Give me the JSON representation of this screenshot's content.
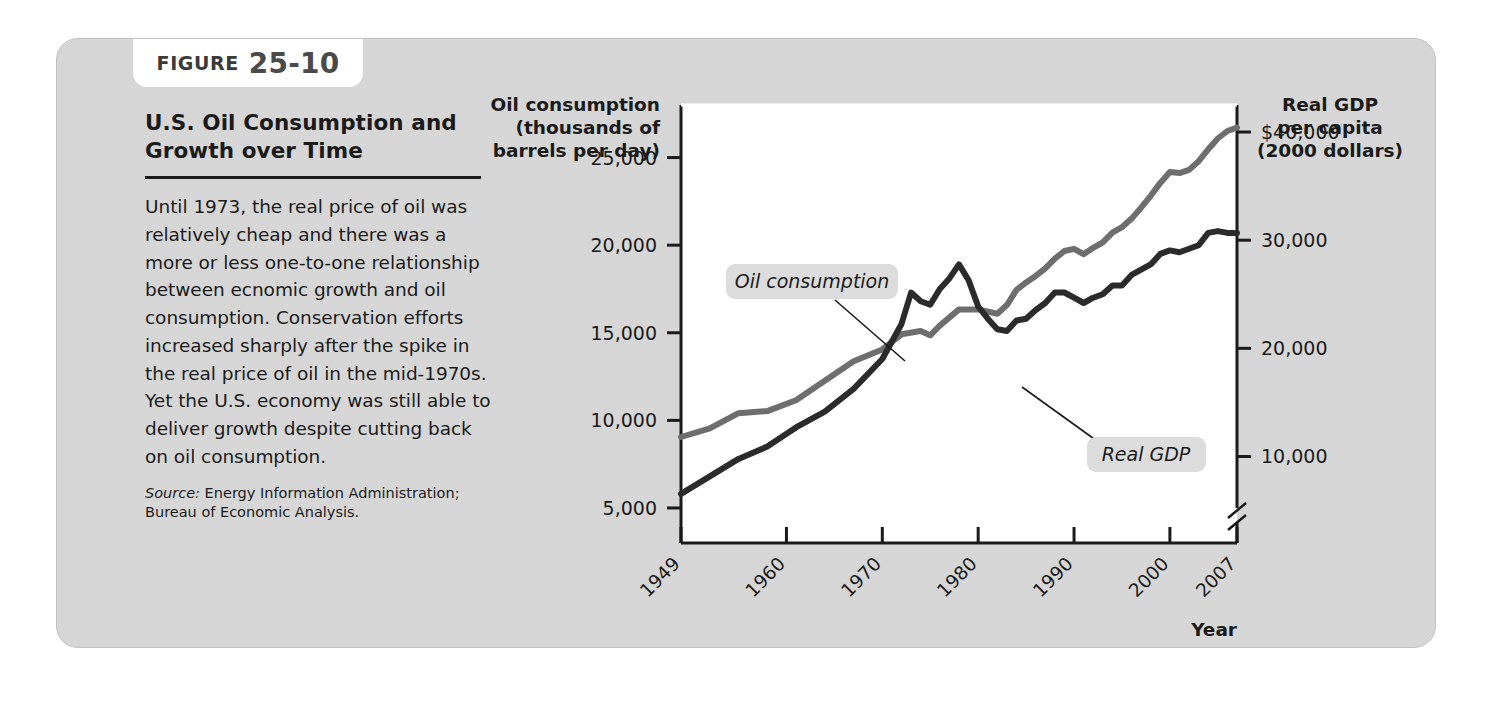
{
  "figure": {
    "label_word": "FIGURE",
    "number": "25-10"
  },
  "caption": {
    "title_line1": "U.S. Oil Consumption and",
    "title_line2": "Growth over Time",
    "body": "Until 1973, the real price of oil was relatively cheap and there was a more or less one-to-one relationship between ecnomic growth and oil consumption. Conservation efforts increased sharply after the spike in the real price of oil in the mid-1970s. Yet the U.S. economy was still able to deliver growth despite cutting back on oil consumption.",
    "source_prefix": "Source:",
    "source_text": " Energy Information Administration; Bureau of Economic Analysis."
  },
  "chart_data": {
    "type": "line",
    "title": "U.S. Oil Consumption and Growth over Time",
    "xlabel": "Year",
    "left_axis": {
      "title_lines": [
        "Oil consumption",
        "(thousands of",
        "barrels per day)"
      ],
      "ticks": [
        "5,000",
        "10,000",
        "15,000",
        "20,000",
        "25,000"
      ],
      "tick_values": [
        5000,
        10000,
        15000,
        20000,
        25000
      ],
      "ylim": [
        3000,
        28000
      ]
    },
    "right_axis": {
      "title_lines": [
        "Real GDP",
        "per capita",
        "(2000 dollars)"
      ],
      "ticks": [
        "10,000",
        "20,000",
        "30,000",
        "$40,000"
      ],
      "tick_values": [
        10000,
        20000,
        30000,
        40000
      ],
      "ylim": [
        2000,
        42500
      ],
      "axis_break": true
    },
    "x_ticks": [
      "1949",
      "1960",
      "1970",
      "1980",
      "1990",
      "2000",
      "2007"
    ],
    "x_tick_values": [
      1949,
      1960,
      1970,
      1980,
      1990,
      2000,
      2007
    ],
    "xlim": [
      1949,
      2007
    ],
    "grid": false,
    "legend_position": "inline-callout",
    "series": [
      {
        "name": "Oil consumption",
        "label": "Oil consumption",
        "color": "#2b2b2b",
        "axis": "left",
        "units": "thousands of barrels per day",
        "x": [
          1949,
          1952,
          1955,
          1958,
          1961,
          1964,
          1967,
          1970,
          1972,
          1973,
          1974,
          1975,
          1976,
          1977,
          1978,
          1979,
          1980,
          1981,
          1982,
          1983,
          1984,
          1985,
          1986,
          1987,
          1988,
          1989,
          1990,
          1991,
          1992,
          1993,
          1994,
          1995,
          1996,
          1997,
          1998,
          1999,
          2000,
          2001,
          2002,
          2003,
          2004,
          2005,
          2006,
          2007
        ],
        "values": [
          5800,
          6800,
          7800,
          8500,
          9600,
          10500,
          11800,
          13500,
          15500,
          17300,
          16800,
          16600,
          17500,
          18100,
          18900,
          18000,
          16500,
          15800,
          15200,
          15100,
          15700,
          15800,
          16300,
          16700,
          17300,
          17300,
          17000,
          16700,
          17000,
          17200,
          17700,
          17700,
          18300,
          18600,
          18900,
          19500,
          19700,
          19600,
          19800,
          20000,
          20700,
          20800,
          20700,
          20700
        ]
      },
      {
        "name": "Real GDP",
        "label": "Real GDP",
        "color": "#6e6e6e",
        "axis": "right",
        "units": "2000 dollars per capita",
        "x": [
          1949,
          1952,
          1955,
          1958,
          1961,
          1964,
          1967,
          1970,
          1972,
          1974,
          1975,
          1976,
          1978,
          1980,
          1982,
          1983,
          1984,
          1985,
          1986,
          1987,
          1988,
          1989,
          1990,
          1991,
          1992,
          1993,
          1994,
          1995,
          1996,
          1997,
          1998,
          1999,
          2000,
          2001,
          2002,
          2003,
          2004,
          2005,
          2006,
          2007
        ],
        "values": [
          11800,
          12600,
          14000,
          14200,
          15200,
          17000,
          18800,
          19900,
          21300,
          21600,
          21200,
          22100,
          23600,
          23600,
          23200,
          24000,
          25400,
          26100,
          26700,
          27400,
          28300,
          29000,
          29200,
          28700,
          29300,
          29800,
          30700,
          31200,
          32000,
          33000,
          34100,
          35300,
          36300,
          36200,
          36500,
          37300,
          38400,
          39400,
          40100,
          40400
        ]
      }
    ],
    "annotations": [
      {
        "text": "Oil consumption",
        "series": "Oil consumption"
      },
      {
        "text": "Real GDP",
        "series": "Real GDP"
      }
    ]
  },
  "axis_names": {
    "x": "Year"
  },
  "colors": {
    "card_background": "#d6d6d6",
    "plot_background": "#ffffff",
    "oil_line": "#2b2b2b",
    "gdp_line": "#6e6e6e",
    "text": "#1a1a1a"
  }
}
